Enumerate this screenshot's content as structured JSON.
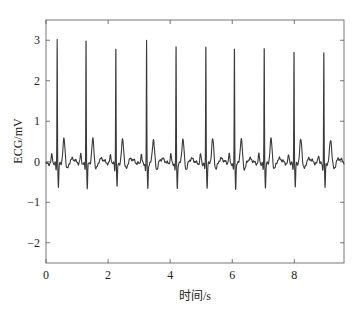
{
  "chart_data": {
    "type": "line",
    "title": "",
    "xlabel": "时间/s",
    "ylabel": "ECG/mV",
    "xlim": [
      0,
      9.6
    ],
    "ylim": [
      -2.5,
      3.5
    ],
    "grid": false,
    "legend": null,
    "x_ticks": [
      0,
      2,
      4,
      6,
      8
    ],
    "x_tick_labels": [
      "0",
      "2",
      "4",
      "6",
      "8"
    ],
    "y_ticks": [
      -2,
      -1,
      0,
      1,
      2,
      3
    ],
    "y_tick_labels": [
      "−2",
      "−1",
      "0",
      "1",
      "2",
      "3"
    ],
    "line_color": "#3a3a3a",
    "series": [
      {
        "name": "ECG",
        "description": "Periodic ECG with 10 beats; each beat: P wave ~0.2 mV, R peak ~3 mV, S trough ~-0.6 mV, T wave ~0.6 mV",
        "r_peaks": [
          {
            "t": 0.36,
            "r": 3.1
          },
          {
            "t": 1.29,
            "r": 3.15
          },
          {
            "t": 2.25,
            "r": 2.95
          },
          {
            "t": 3.24,
            "r": 3.0
          },
          {
            "t": 4.19,
            "r": 2.95
          },
          {
            "t": 5.15,
            "r": 3.0
          },
          {
            "t": 6.07,
            "r": 2.9
          },
          {
            "t": 7.03,
            "r": 2.95
          },
          {
            "t": 7.99,
            "r": 2.9
          },
          {
            "t": 8.95,
            "r": 2.85
          }
        ],
        "p_wave_amp": 0.22,
        "q_amp": -0.15,
        "s_trough": -0.6,
        "t_wave_amp": 0.6,
        "baseline": -0.05
      }
    ]
  }
}
